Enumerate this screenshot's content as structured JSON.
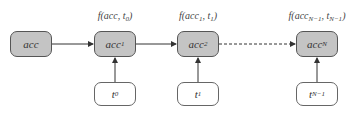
{
  "diagram": {
    "type": "fold/accumulator chain",
    "accumulators": [
      {
        "id": "acc",
        "label": "acc",
        "sub": ""
      },
      {
        "id": "acc1",
        "label": "acc",
        "sub": "1"
      },
      {
        "id": "acc2",
        "label": "acc",
        "sub": "2"
      },
      {
        "id": "accN",
        "label": "acc",
        "sub": "N"
      }
    ],
    "inputs": [
      {
        "id": "t0",
        "label": "t",
        "sub": "0"
      },
      {
        "id": "t1",
        "label": "t",
        "sub": "1"
      },
      {
        "id": "tN1",
        "label": "t",
        "sub": "N−1"
      }
    ],
    "function_labels": [
      {
        "prefix": "f(acc, t",
        "sub": "0",
        "suffix": ")"
      },
      {
        "prefix": "f(acc",
        "sub": "1",
        "mid": ", t",
        "sub2": "1",
        "suffix": ")"
      },
      {
        "prefix": "f(acc",
        "sub": "N−1",
        "mid": ", t",
        "sub2": "N−1",
        "suffix": ")"
      }
    ],
    "edges": [
      {
        "from": "acc",
        "to": "acc1",
        "style": "solid"
      },
      {
        "from": "acc1",
        "to": "acc2",
        "style": "solid"
      },
      {
        "from": "acc2",
        "to": "accN",
        "style": "dashed"
      },
      {
        "from": "t0",
        "to": "acc1",
        "style": "solid"
      },
      {
        "from": "t1",
        "to": "acc2",
        "style": "solid"
      },
      {
        "from": "tN1",
        "to": "accN",
        "style": "solid"
      }
    ],
    "colors": {
      "acc_fill": "#c4c4c4",
      "input_fill": "#ffffff",
      "stroke": "#555555"
    }
  }
}
